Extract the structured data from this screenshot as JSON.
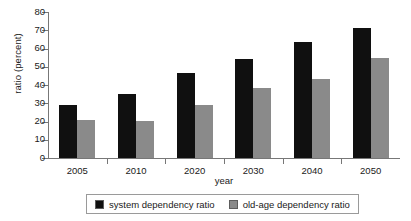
{
  "chart_data": {
    "type": "bar",
    "title": "",
    "xlabel": "year",
    "ylabel": "ratio (percent)",
    "categories": [
      "2005",
      "2010",
      "2020",
      "2030",
      "2040",
      "2050"
    ],
    "series": [
      {
        "name": "system dependency ratio",
        "color": "#101010",
        "values": [
          29,
          35,
          46.5,
          54,
          63.5,
          71.5
        ]
      },
      {
        "name": "old-age dependency ratio",
        "color": "#8a8a8a",
        "values": [
          21,
          20.5,
          29,
          38.5,
          43.5,
          55
        ]
      }
    ],
    "ylim": [
      0,
      80
    ],
    "ytick_values": [
      0,
      10,
      20,
      30,
      40,
      50,
      60,
      70,
      80
    ],
    "ytick_labels": [
      "0",
      "10",
      "20",
      "30",
      "40",
      "50",
      "60",
      "70",
      "80"
    ],
    "grid": false,
    "legend_position": "bottom-center"
  }
}
